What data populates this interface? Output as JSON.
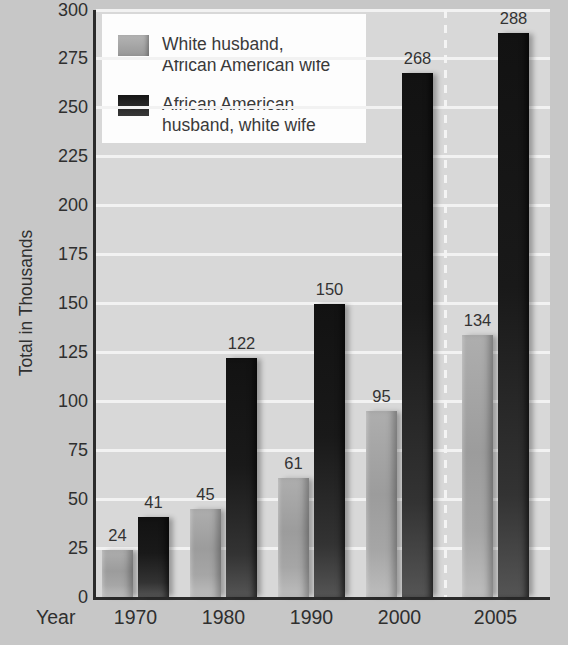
{
  "chart_data": {
    "type": "bar",
    "title": "",
    "xlabel": "Year",
    "ylabel": "Total in Thousands",
    "ylim": [
      0,
      300
    ],
    "ytick_step": 25,
    "grid": true,
    "legend_position": "top-left",
    "categories": [
      "1970",
      "1980",
      "1990",
      "2000",
      "2005"
    ],
    "series": [
      {
        "name": "White husband, African American wife",
        "color": "#a9a9a9",
        "values": [
          24,
          45,
          61,
          95,
          134
        ]
      },
      {
        "name": "African American husband, white wife",
        "color": "#1e1e1e",
        "values": [
          41,
          122,
          150,
          268,
          288
        ]
      }
    ],
    "separator_before_category": "2005",
    "value_labels_shown": true
  },
  "legend": {
    "items": [
      {
        "line1": "White husband,",
        "line2": "African American wife",
        "swatch": "light"
      },
      {
        "line1": "African American",
        "line2": "husband, white wife",
        "swatch": "dark"
      }
    ]
  },
  "colors": {
    "page_bg": "#c7c7c7",
    "plot_bg": "#d8d8d8",
    "gridline": "#f2f2f2",
    "axis": "#2b2b2b",
    "text": "#2f2f2f",
    "legend_bg": "#fdfdfd",
    "separator_dash": "#f4f4f4"
  }
}
